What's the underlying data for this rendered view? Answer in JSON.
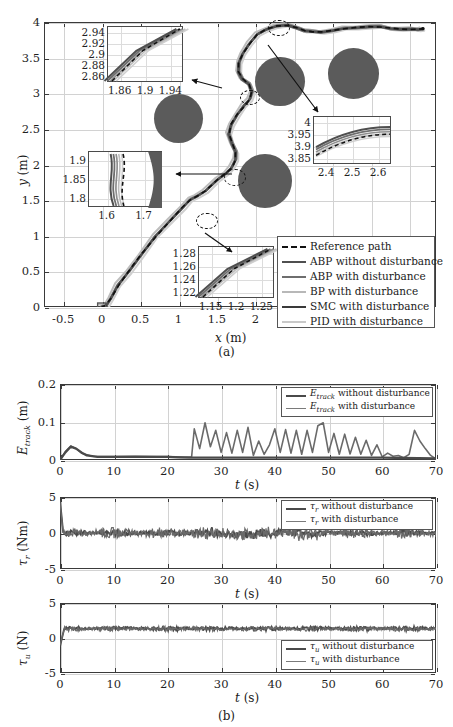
{
  "figure": {
    "caption_a": "(a)",
    "caption_b": "(b)"
  },
  "main_plot": {
    "xlabel_var": "x",
    "xlabel_unit": "(m)",
    "ylabel_var": "y",
    "ylabel_unit": "(m)",
    "xticks": [
      "-0.5",
      "0",
      "0.5",
      "1",
      "1.5",
      "2",
      "2.5",
      "3",
      "3.5",
      "4"
    ],
    "yticks": [
      "0",
      "0.5",
      "1",
      "1.5",
      "2",
      "2.5",
      "3",
      "3.5",
      "4"
    ],
    "xlim": [
      -0.75,
      4.35
    ],
    "ylim": [
      0,
      4.0
    ],
    "legend": [
      {
        "label": "Reference path",
        "color": "#111111",
        "dash": true,
        "width": 2.2
      },
      {
        "label": "ABP without disturbance",
        "color": "#4f4f4f",
        "dash": false,
        "width": 2.6
      },
      {
        "label": "ABP with disturbance",
        "color": "#6e6e6e",
        "dash": false,
        "width": 2.2
      },
      {
        "label": "BP with disturbance",
        "color": "#b8b8b8",
        "dash": false,
        "width": 2.0
      },
      {
        "label": "SMC with disturbance",
        "color": "#3a3a3a",
        "dash": false,
        "width": 2.0
      },
      {
        "label": "PID with disturbance",
        "color": "#c9c9c9",
        "dash": false,
        "width": 2.0
      }
    ],
    "obstacles": [
      {
        "cx": 1.0,
        "cy": 2.65,
        "r": 0.32
      },
      {
        "cx": 2.32,
        "cy": 3.17,
        "r": 0.32
      },
      {
        "cx": 3.28,
        "cy": 3.28,
        "r": 0.33
      },
      {
        "cx": 2.13,
        "cy": 1.77,
        "r": 0.35
      }
    ],
    "insets": [
      {
        "name": "inset-top-left",
        "xticks": [
          "1.86",
          "1.9",
          "1.94"
        ],
        "yticks": [
          "2.94",
          "2.92",
          "2.9",
          "2.88",
          "2.86"
        ]
      },
      {
        "name": "inset-mid-left",
        "xticks": [
          "1.6",
          "1.7"
        ],
        "yticks": [
          "1.9",
          "1.85",
          "1.8"
        ]
      },
      {
        "name": "inset-bottom",
        "xticks": [
          "1.15",
          "1.2",
          "1.25"
        ],
        "yticks": [
          "1.28",
          "1.26",
          "1.24",
          "1.22"
        ]
      },
      {
        "name": "inset-right",
        "xticks": [
          "2.4",
          "2.5",
          "2.6"
        ],
        "yticks": [
          "4",
          "3.95",
          "3.9",
          "3.85"
        ]
      }
    ]
  },
  "chart_data": [
    {
      "type": "line",
      "name": "trajectory-xy",
      "title": "",
      "xlabel": "x (m)",
      "ylabel": "y (m)",
      "xlim": [
        -0.75,
        4.35
      ],
      "ylim": [
        0,
        4.0
      ],
      "grid": true,
      "legend_position": "bottom-right",
      "series": [
        {
          "name": "Reference path",
          "color": "#111111",
          "style": "dashed",
          "x": [
            0.0,
            0.1,
            0.3,
            0.6,
            0.9,
            1.2,
            1.5,
            1.68,
            1.72,
            1.8,
            1.9,
            1.95,
            1.9,
            1.8,
            1.75,
            1.8,
            1.88,
            1.93,
            1.9,
            1.95,
            2.1,
            2.3,
            2.5,
            2.62,
            2.75,
            3.0,
            3.3,
            3.6,
            3.9,
            4.1,
            4.2
          ],
          "y": [
            0.0,
            0.18,
            0.45,
            0.78,
            1.1,
            1.42,
            1.72,
            1.85,
            1.95,
            2.1,
            2.35,
            2.6,
            2.8,
            2.88,
            2.95,
            3.05,
            3.2,
            3.45,
            3.7,
            3.85,
            3.95,
            3.97,
            3.93,
            3.88,
            3.86,
            3.88,
            3.93,
            3.95,
            3.9,
            3.88,
            3.9
          ]
        },
        {
          "name": "ABP without disturbance",
          "color": "#4f4f4f",
          "style": "solid"
        },
        {
          "name": "ABP with disturbance",
          "color": "#6e6e6e",
          "style": "solid"
        },
        {
          "name": "BP with disturbance",
          "color": "#b8b8b8",
          "style": "solid"
        },
        {
          "name": "SMC with disturbance",
          "color": "#3a3a3a",
          "style": "solid"
        },
        {
          "name": "PID with disturbance",
          "color": "#c9c9c9",
          "style": "solid"
        }
      ],
      "obstacles": [
        {
          "cx": 1.0,
          "cy": 2.65,
          "r": 0.32
        },
        {
          "cx": 2.32,
          "cy": 3.17,
          "r": 0.32
        },
        {
          "cx": 3.28,
          "cy": 3.28,
          "r": 0.33
        },
        {
          "cx": 2.13,
          "cy": 1.77,
          "r": 0.35
        }
      ]
    },
    {
      "type": "line",
      "name": "tracking-error",
      "title": "",
      "xlabel": "t (s)",
      "ylabel": "E_track (m)",
      "xlim": [
        0,
        70
      ],
      "ylim": [
        0,
        0.2
      ],
      "xticks": [
        0,
        10,
        20,
        30,
        40,
        50,
        60,
        70
      ],
      "yticks": [
        0,
        0.1,
        0.2
      ],
      "grid": true,
      "legend_position": "top-right",
      "series": [
        {
          "name": "E_track without disturbance",
          "color": "#4a4a4a",
          "x": [
            0,
            1,
            2,
            3,
            4,
            5,
            7,
            10,
            14,
            18,
            20,
            22,
            24,
            25,
            30,
            40,
            50,
            60,
            70
          ],
          "y": [
            0.0,
            0.02,
            0.035,
            0.03,
            0.02,
            0.012,
            0.008,
            0.008,
            0.009,
            0.008,
            0.008,
            0.007,
            0.006,
            0.006,
            0.006,
            0.006,
            0.006,
            0.006,
            0.004
          ]
        },
        {
          "name": "E_track with disturbance",
          "color": "#6a6a6a",
          "x": [
            0,
            1,
            2,
            3,
            4,
            6,
            8,
            12,
            16,
            20,
            23,
            24.5,
            25,
            26,
            27,
            28,
            29,
            30,
            31,
            32,
            33,
            34,
            35,
            36,
            37,
            38,
            39,
            40,
            41,
            42,
            43,
            44,
            45,
            46,
            47,
            48,
            49,
            50,
            51,
            52,
            53,
            54,
            55,
            56,
            57,
            58,
            59,
            60,
            61,
            62,
            63,
            64,
            65,
            66,
            67,
            68,
            69,
            70
          ],
          "y": [
            0.0,
            0.022,
            0.037,
            0.03,
            0.018,
            0.01,
            0.009,
            0.009,
            0.009,
            0.009,
            0.008,
            0.008,
            0.082,
            0.03,
            0.098,
            0.035,
            0.078,
            0.02,
            0.072,
            0.018,
            0.078,
            0.02,
            0.086,
            0.012,
            0.05,
            0.015,
            0.04,
            0.082,
            0.02,
            0.08,
            0.018,
            0.078,
            0.015,
            0.078,
            0.02,
            0.09,
            0.098,
            0.02,
            0.07,
            0.015,
            0.068,
            0.016,
            0.06,
            0.015,
            0.052,
            0.012,
            0.04,
            0.008,
            0.018,
            0.01,
            0.012,
            0.006,
            0.015,
            0.078,
            0.05,
            0.03,
            0.012,
            0.003
          ]
        }
      ]
    },
    {
      "type": "line",
      "name": "torque-tau-r",
      "title": "",
      "xlabel": "t (s)",
      "ylabel": "tau_r (Nm)",
      "xlim": [
        0,
        70
      ],
      "ylim": [
        -5,
        5
      ],
      "xticks": [
        0,
        10,
        20,
        30,
        40,
        50,
        60,
        70
      ],
      "yticks": [
        -5,
        0,
        5
      ],
      "grid": true,
      "legend_position": "top-right",
      "series": [
        {
          "name": "tau_r without disturbance",
          "color": "#4a4a4a",
          "mean": 0.0,
          "noise_amp": 0.3,
          "spike_t": 0.3,
          "spike_y": 4.5
        },
        {
          "name": "tau_r with disturbance",
          "color": "#6a6a6a",
          "mean": 0.0,
          "noise_amp": 0.6,
          "spike_t": 0.3,
          "spike_y": 4.2
        }
      ]
    },
    {
      "type": "line",
      "name": "force-tau-u",
      "title": "",
      "xlabel": "t (s)",
      "ylabel": "tau_u (N)",
      "xlim": [
        0,
        70
      ],
      "ylim": [
        -5,
        5
      ],
      "xticks": [
        0,
        10,
        20,
        30,
        40,
        50,
        60,
        70
      ],
      "yticks": [
        -5,
        0,
        5
      ],
      "grid": true,
      "legend_position": "bottom-right",
      "series": [
        {
          "name": "tau_u without disturbance",
          "color": "#4a4a4a",
          "mean": 1.35,
          "noise_amp": 0.22,
          "spike_t": 0.4,
          "spike_y": -1.2
        },
        {
          "name": "tau_u with disturbance",
          "color": "#6a6a6a",
          "mean": 1.3,
          "noise_amp": 0.3,
          "spike_t": 0.4,
          "spike_y": -1.0
        }
      ]
    }
  ],
  "sub_plots": {
    "etrack": {
      "ylabel_var": "E",
      "ylabel_sub": "track",
      "ylabel_unit": "(m)",
      "xlabel_var": "t",
      "xlabel_unit": "(s)",
      "xticks": [
        "0",
        "10",
        "20",
        "30",
        "40",
        "50",
        "60",
        "70"
      ],
      "yticks": [
        "0",
        "0.1",
        "0.2"
      ],
      "legend": [
        {
          "label_var": "E",
          "label_sub": "track",
          "label_rest": " without disturbance",
          "color": "#4a4a4a",
          "width": 2.6
        },
        {
          "label_var": "E",
          "label_sub": "track",
          "label_rest": " with disturbance",
          "color": "#7a7a7a",
          "width": 1.8
        }
      ]
    },
    "tau_r": {
      "ylabel_var": "τ",
      "ylabel_sub": "r",
      "ylabel_unit": "(Nm)",
      "xlabel_var": "t",
      "xlabel_unit": "(s)",
      "xticks": [
        "0",
        "10",
        "20",
        "30",
        "40",
        "50",
        "60",
        "70"
      ],
      "yticks": [
        "-5",
        "0",
        "5"
      ],
      "legend": [
        {
          "label_var": "τ",
          "label_sub": "r",
          "label_rest": " without disturbance",
          "color": "#4a4a4a",
          "width": 2.6
        },
        {
          "label_var": "τ",
          "label_sub": "r",
          "label_rest": " with disturbance",
          "color": "#7a7a7a",
          "width": 1.8
        }
      ]
    },
    "tau_u": {
      "ylabel_var": "τ",
      "ylabel_sub": "u",
      "ylabel_unit": "(N)",
      "xlabel_var": "t",
      "xlabel_unit": "(s)",
      "xticks": [
        "0",
        "10",
        "20",
        "30",
        "40",
        "50",
        "60",
        "70"
      ],
      "yticks": [
        "-5",
        "0",
        "5"
      ],
      "legend": [
        {
          "label_var": "τ",
          "label_sub": "u",
          "label_rest": " without disturbance",
          "color": "#4a4a4a",
          "width": 2.6
        },
        {
          "label_var": "τ",
          "label_sub": "u",
          "label_rest": " with disturbance",
          "color": "#7a7a7a",
          "width": 1.8
        }
      ]
    }
  }
}
